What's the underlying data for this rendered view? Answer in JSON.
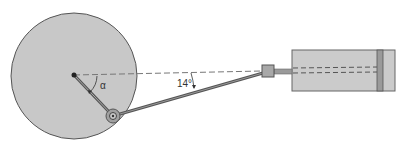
{
  "diagram": {
    "labels": {
      "crank_angle": "α",
      "rod_angle": "14°"
    },
    "colors": {
      "background": "#ffffff",
      "wheel_fill": "#c8c8c8",
      "wheel_stroke": "#555555",
      "rod": "#555555",
      "cylinder_fill": "#cbcbcb",
      "crosshead_fill": "#a8a8a8",
      "piston_fill": "#9a9a9a"
    }
  }
}
